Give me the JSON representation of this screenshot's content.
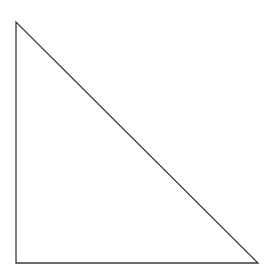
{
  "shape": {
    "type": "right-triangle",
    "vertices": [
      [
        16,
        22
      ],
      [
        16,
        263
      ],
      [
        258,
        263
      ]
    ],
    "stroke": "#3a3a3a",
    "fill": "#ffffff",
    "stroke_width": "1.3"
  }
}
